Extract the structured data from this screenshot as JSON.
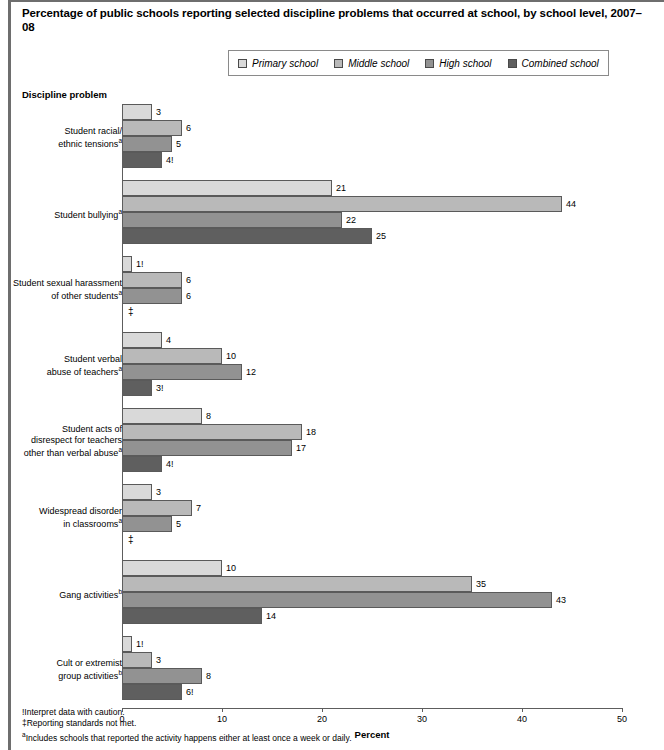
{
  "title": "Percentage of public schools reporting selected discipline problems that occurred at school, by school level, 2007–08",
  "axis_title_y": "Discipline problem",
  "axis_title_x": "Percent",
  "legend": {
    "items": [
      {
        "label": "Primary school",
        "color": "#d9d9d9"
      },
      {
        "label": "Middle school",
        "color": "#b9b9b9"
      },
      {
        "label": "High school",
        "color": "#929292"
      },
      {
        "label": "Combined school",
        "color": "#5f5f5f"
      }
    ]
  },
  "footnotes": [
    "!Interpret data with caution.",
    "‡Reporting standards not met.",
    "a Includes schools that reported the activity happens either at least once a week or daily."
  ],
  "chart_data": {
    "type": "bar",
    "orientation": "horizontal",
    "title": "Percentage of public schools reporting selected discipline problems that occurred at school, by school level, 2007–08",
    "xlabel": "Percent",
    "ylabel": "Discipline problem",
    "xlim": [
      0,
      50
    ],
    "xticks": [
      0,
      10,
      20,
      30,
      40,
      50
    ],
    "grid": false,
    "legend_position": "top-center",
    "categories": [
      "Student racial/ethnic tensionsᵃ",
      "Student bullyingᵃ",
      "Student sexual harassment of other studentsᵃ",
      "Student verbal abuse of teachersᵃ",
      "Student acts of disrespect for teachers other than verbal abuseᵃ",
      "Widespread disorder in classroomsᵃ",
      "Gang activitiesᵇ",
      "Cult or extremist group activitiesᵇ"
    ],
    "category_lines": [
      [
        "Student racial/",
        "ethnic tensions",
        "a"
      ],
      [
        "Student bullying",
        "a"
      ],
      [
        "Student sexual harassment",
        "of other students",
        "a"
      ],
      [
        "Student verbal",
        "abuse of teachers",
        "a"
      ],
      [
        "Student acts of",
        "disrespect for teachers",
        "other than verbal abuse",
        "a"
      ],
      [
        "Widespread disorder",
        "in classrooms",
        "a"
      ],
      [
        "Gang activities",
        "b"
      ],
      [
        "Cult or extremist",
        "group activities",
        "b"
      ]
    ],
    "series": [
      {
        "name": "Primary school",
        "color": "#d9d9d9",
        "values": [
          3,
          21,
          1,
          4,
          8,
          3,
          10,
          1
        ],
        "labels": [
          "3",
          "21",
          "1!",
          "4",
          "8",
          "3",
          "10",
          "1!"
        ]
      },
      {
        "name": "Middle school",
        "color": "#b9b9b9",
        "values": [
          6,
          44,
          6,
          10,
          18,
          7,
          35,
          3
        ],
        "labels": [
          "6",
          "44",
          "6",
          "10",
          "18",
          "7",
          "35",
          "3"
        ]
      },
      {
        "name": "High school",
        "color": "#929292",
        "values": [
          5,
          22,
          6,
          12,
          17,
          5,
          43,
          8
        ],
        "labels": [
          "5",
          "22",
          "6",
          "12",
          "17",
          "5",
          "43",
          "8"
        ]
      },
      {
        "name": "Combined school",
        "color": "#5f5f5f",
        "values": [
          4,
          25,
          null,
          3,
          4,
          null,
          14,
          6
        ],
        "labels": [
          "4!",
          "25",
          "‡",
          "3!",
          "4!",
          "‡",
          "14",
          "6!"
        ]
      }
    ]
  }
}
